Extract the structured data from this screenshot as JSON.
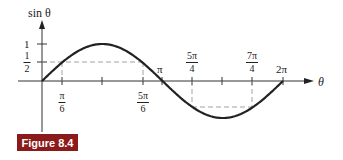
{
  "chart_data": {
    "type": "line",
    "title": "",
    "function": "sin(theta)",
    "xlabel": "θ",
    "ylabel": "sin θ",
    "x_range": [
      0,
      6.2832
    ],
    "ylim": [
      -1,
      1
    ],
    "x_ticks": [
      {
        "value": 0.5236,
        "label_num": "π",
        "label_den": "6"
      },
      {
        "value": 1.5708,
        "label": ""
      },
      {
        "value": 2.618,
        "label_num": "5π",
        "label_den": "6"
      },
      {
        "value": 3.1416,
        "label": "π"
      },
      {
        "value": 3.927,
        "label_num": "5π",
        "label_den": "4"
      },
      {
        "value": 4.7124,
        "label": ""
      },
      {
        "value": 5.4978,
        "label_num": "7π",
        "label_den": "4"
      },
      {
        "value": 6.2832,
        "label": "2π"
      }
    ],
    "y_ticks": [
      {
        "value": 1,
        "label": "1"
      },
      {
        "value": 0.5,
        "label_num": "1",
        "label_den": "2"
      }
    ],
    "annotations": [
      {
        "type": "dashed-horizontal",
        "y": 0.5,
        "from_x": 0.5236,
        "to_x": 2.618
      },
      {
        "type": "dashed-vertical",
        "x": 0.5236,
        "from_y": 0,
        "to_y": 0.5
      },
      {
        "type": "dashed-vertical",
        "x": 2.618,
        "from_y": 0,
        "to_y": 0.5
      },
      {
        "type": "dashed-horizontal",
        "y": -0.7071,
        "from_x": 3.927,
        "to_x": 5.4978
      },
      {
        "type": "dashed-vertical",
        "x": 3.927,
        "from_y": 0,
        "to_y": -0.7071
      },
      {
        "type": "dashed-vertical",
        "x": 5.4978,
        "from_y": 0,
        "to_y": -0.7071
      }
    ],
    "points": [
      {
        "x": 0,
        "y": 0
      },
      {
        "x": 0.5236,
        "y": 0.5
      },
      {
        "x": 1.5708,
        "y": 1
      },
      {
        "x": 2.618,
        "y": 0.5
      },
      {
        "x": 3.1416,
        "y": 0
      },
      {
        "x": 3.927,
        "y": -0.7071
      },
      {
        "x": 4.7124,
        "y": -1
      },
      {
        "x": 5.4978,
        "y": -0.7071
      },
      {
        "x": 6.2832,
        "y": 0
      }
    ],
    "grid": false,
    "legend": null
  },
  "labels": {
    "y_axis": "sin θ",
    "x_axis": "θ",
    "y_one": "1",
    "y_half_num": "1",
    "y_half_den": "2",
    "x_pi6_num": "π",
    "x_pi6_den": "6",
    "x_5pi6_num": "5π",
    "x_5pi6_den": "6",
    "x_pi": "π",
    "x_5pi4_num": "5π",
    "x_5pi4_den": "4",
    "x_7pi4_num": "7π",
    "x_7pi4_den": "4",
    "x_2pi": "2π"
  },
  "figure_label": "Figure 8.4",
  "colors": {
    "curve": "#222222",
    "axes": "#333333",
    "dashed": "#999999",
    "figure_label_bg": "#8b1a1a"
  }
}
